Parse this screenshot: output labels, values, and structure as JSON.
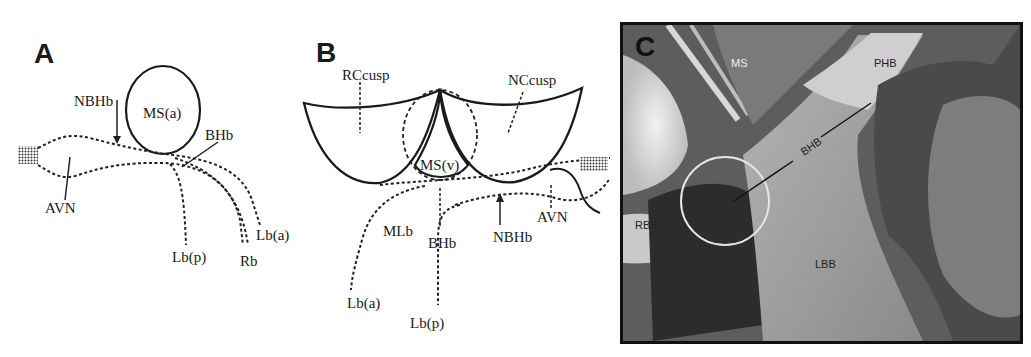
{
  "figure": {
    "panels": [
      {
        "id": "A",
        "letter": "A",
        "type": "schematic",
        "labels": {
          "ms": "MS(a)",
          "nbhb": "NBHb",
          "bhb": "BHb",
          "avn": "AVN",
          "lb_a": "Lb(a)",
          "lb_p": "Lb(p)",
          "rb": "Rb"
        }
      },
      {
        "id": "B",
        "letter": "B",
        "type": "schematic",
        "labels": {
          "rccusp": "RCcusp",
          "nccusp": "NCcusp",
          "ms": "MS(v)",
          "mlb": "MLb",
          "bhb": "BHb",
          "nbhb": "NBHb",
          "avn": "AVN",
          "lb_a": "Lb(a)",
          "lb_p": "Lb(p)"
        }
      },
      {
        "id": "C",
        "letter": "C",
        "type": "photograph",
        "labels": {
          "ms": "MS",
          "phb": "PHB",
          "bhb": "BHB",
          "rbb": "RBB",
          "lbb": "LBB"
        }
      }
    ]
  }
}
